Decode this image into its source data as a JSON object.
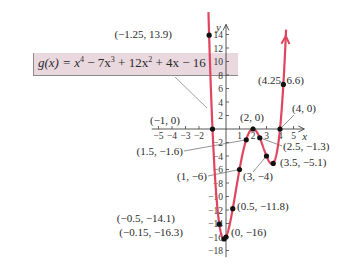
{
  "chart_data": {
    "type": "line",
    "title": "",
    "function_label": "g(x) = x^4 − 7x^3 + 12x^2 + 4x − 16",
    "function_display": {
      "name": "g(x) = ",
      "terms": [
        "x",
        "4",
        " − 7x",
        "3",
        " + 12x",
        "2",
        " + 4x − 16"
      ]
    },
    "xlabel": "x",
    "ylabel": "y",
    "xlim": [
      -5.5,
      5.8
    ],
    "ylim": [
      -19,
      15.5
    ],
    "x_ticks": [
      -5,
      -4,
      -3,
      -2,
      1,
      2,
      3,
      4,
      5
    ],
    "y_ticks": [
      14,
      12,
      10,
      8,
      6,
      4,
      2,
      -2,
      -4,
      -6,
      -8,
      -10,
      -12,
      -14,
      -16,
      -18
    ],
    "grid": false,
    "curve_color": "#e0455f",
    "labeled_points": [
      {
        "x": -1.25,
        "y": 13.9,
        "label": "(−1.25, 13.9)"
      },
      {
        "x": -1,
        "y": 0,
        "label": "(−1, 0)"
      },
      {
        "x": -0.5,
        "y": -14.1,
        "label": "(−0.5, −14.1)"
      },
      {
        "x": -0.15,
        "y": -16.3,
        "label": "(−0.15, −16.3)"
      },
      {
        "x": 0,
        "y": -16,
        "label": "(0, −16)"
      },
      {
        "x": 0.5,
        "y": -11.8,
        "label": "(0.5, −11.8)"
      },
      {
        "x": 1,
        "y": -6,
        "label": "(1, −6)"
      },
      {
        "x": 1.5,
        "y": -1.6,
        "label": "(1.5, −1.6)"
      },
      {
        "x": 2,
        "y": 0,
        "label": "(2, 0)"
      },
      {
        "x": 2.5,
        "y": -1.3,
        "label": "(2.5, −1.3)"
      },
      {
        "x": 3,
        "y": -4,
        "label": "(3, −4)"
      },
      {
        "x": 3.5,
        "y": -5.1,
        "label": "(3.5, −5.1)"
      },
      {
        "x": 4,
        "y": 0,
        "label": "(4, 0)"
      },
      {
        "x": 4.25,
        "y": 6.6,
        "label": "(4.25, 6.6)"
      }
    ]
  }
}
